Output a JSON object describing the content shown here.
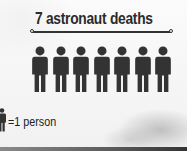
{
  "chart_data": {
    "type": "pictogram",
    "title": "7 astronaut deaths",
    "values": [
      7
    ],
    "categories": [
      "astronaut deaths"
    ],
    "unit_icon": "person-icon",
    "unit_value": 1,
    "legend": "=1 person",
    "icon_color": "#333333"
  },
  "title": "7 astronaut deaths",
  "legend": {
    "label": "=1 person",
    "icon": "person-icon"
  },
  "people": [
    {
      "icon": "person-icon"
    },
    {
      "icon": "person-icon"
    },
    {
      "icon": "person-icon"
    },
    {
      "icon": "person-icon"
    },
    {
      "icon": "person-icon"
    },
    {
      "icon": "person-icon"
    },
    {
      "icon": "person-icon"
    }
  ]
}
